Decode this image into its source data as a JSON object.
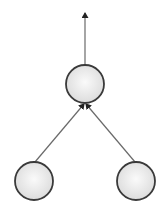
{
  "diagram": {
    "type": "tree",
    "colors": {
      "background": "#ffffff",
      "node_stroke": "#3a3a3a",
      "node_fill_light": "#fafafa",
      "node_fill_dark": "#dcdcdc",
      "edge": "#6a6a6a",
      "arrowhead": "#222222"
    },
    "nodes": [
      {
        "id": "root",
        "label": "",
        "cx": 85,
        "cy": 84,
        "r": 19
      },
      {
        "id": "left-child",
        "label": "",
        "cx": 34,
        "cy": 181,
        "r": 19
      },
      {
        "id": "right-child",
        "label": "",
        "cx": 136,
        "cy": 181,
        "r": 19
      }
    ],
    "edges": [
      {
        "from": "root",
        "to": "output",
        "x1": 85,
        "y1": 65,
        "x2": 85,
        "y2": 13,
        "directed": true
      },
      {
        "from": "left-child",
        "to": "root",
        "x1": 35,
        "y1": 162,
        "x2": 84,
        "y2": 104,
        "directed": true
      },
      {
        "from": "right-child",
        "to": "root",
        "x1": 135,
        "y1": 162,
        "x2": 86,
        "y2": 104,
        "directed": true
      }
    ]
  }
}
